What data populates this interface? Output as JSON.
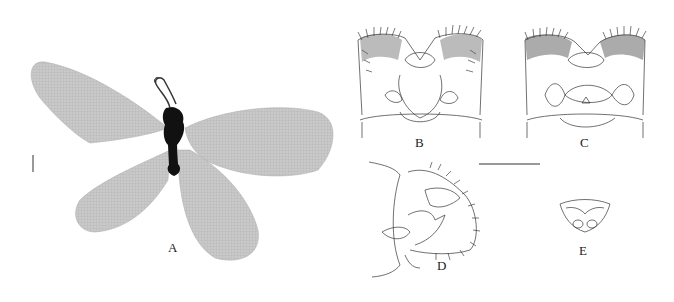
{
  "figure": {
    "panels": [
      {
        "id": "A",
        "label": "A",
        "content": "habitus-wings"
      },
      {
        "id": "B",
        "label": "B",
        "content": "genitalia-dorsal"
      },
      {
        "id": "C",
        "label": "C",
        "content": "genitalia-ventral"
      },
      {
        "id": "D",
        "label": "D",
        "content": "genitalia-lateral"
      },
      {
        "id": "E",
        "label": "E",
        "content": "genital-structure-small"
      }
    ],
    "scale_bars": [
      {
        "panel": "A",
        "orientation": "vertical"
      },
      {
        "panel": "B-E",
        "orientation": "horizontal"
      }
    ],
    "colors": {
      "ink": "#222222",
      "wing": "#b8b8b8",
      "body": "#111111"
    }
  }
}
